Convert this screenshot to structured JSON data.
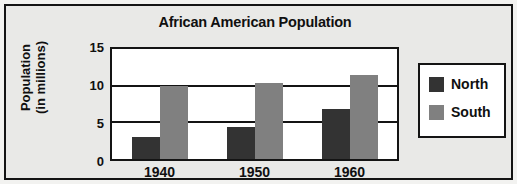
{
  "chart_data": {
    "type": "bar",
    "title": "African American Population",
    "xlabel": "",
    "ylabel": "Population\n(in millions)",
    "ylabel_line1": "Population",
    "ylabel_line2": "(in millions)",
    "categories": [
      "1940",
      "1950",
      "1960"
    ],
    "yticks": [
      "15",
      "10",
      "5",
      "0"
    ],
    "ytick_values": [
      15,
      10,
      5,
      0
    ],
    "ylim": [
      0,
      15
    ],
    "grid": true,
    "legend_position": "right",
    "series": [
      {
        "name": "North",
        "color": "#333333",
        "values": [
          3.0,
          4.4,
          6.8
        ]
      },
      {
        "name": "South",
        "color": "#808080",
        "values": [
          10.0,
          10.3,
          11.5
        ]
      }
    ]
  },
  "legend": {
    "items": [
      {
        "label": "North",
        "swatch": "north"
      },
      {
        "label": "South",
        "swatch": "south"
      }
    ]
  },
  "colors": {
    "north": "#333333",
    "south": "#808080",
    "panel_background": "#e9e9e7",
    "plot_background": "#ffffff",
    "ink": "#141414"
  }
}
